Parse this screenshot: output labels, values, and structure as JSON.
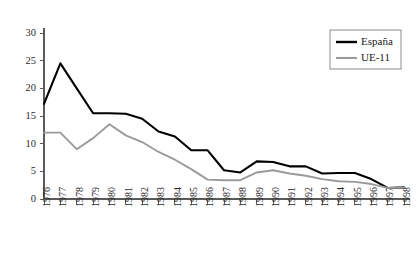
{
  "chart_data": {
    "type": "line",
    "title": "",
    "subtitle": "",
    "xlabel": "",
    "ylabel": "",
    "grid": false,
    "legend_position": "top-right",
    "xlim": [
      1976,
      1998
    ],
    "ylim": [
      0,
      30
    ],
    "ytick_values": [
      0,
      5,
      10,
      15,
      20,
      25,
      30
    ],
    "ytick_labels": [
      "0",
      "5",
      "10",
      "15",
      "20",
      "25",
      "30"
    ],
    "categories": [
      "1976",
      "1977",
      "1978",
      "1979",
      "1980",
      "1981",
      "1982",
      "1983",
      "1984",
      "1985",
      "1986",
      "1987",
      "1988",
      "1989",
      "1990",
      "1991",
      "1992",
      "1993",
      "1994",
      "1995",
      "1996",
      "1997",
      "1998"
    ],
    "series": [
      {
        "name": "España",
        "color": "#000000",
        "values": [
          17.2,
          24.5,
          20.0,
          15.5,
          15.5,
          15.4,
          14.5,
          12.2,
          11.3,
          8.8,
          8.8,
          5.2,
          4.8,
          6.8,
          6.7,
          5.9,
          5.9,
          4.6,
          4.7,
          4.7,
          3.6,
          2.0,
          2.1
        ]
      },
      {
        "name": "UE-11",
        "color": "#9a9a9a",
        "values": [
          12.0,
          12.0,
          9.0,
          11.0,
          13.5,
          11.5,
          10.3,
          8.5,
          7.1,
          5.4,
          3.5,
          3.4,
          3.4,
          4.8,
          5.2,
          4.6,
          4.2,
          3.6,
          3.2,
          3.1,
          2.7,
          2.0,
          2.1
        ]
      }
    ]
  },
  "legend": {
    "entries": [
      {
        "label": "España"
      },
      {
        "label": "UE-11"
      }
    ]
  }
}
